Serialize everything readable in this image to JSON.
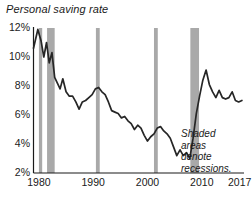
{
  "chart_data": {
    "type": "line",
    "title": "Personal saving rate",
    "xlabel": "",
    "ylabel": "",
    "xlim": [
      1979.0,
      2017.6
    ],
    "ylim": [
      2,
      12
    ],
    "grid": false,
    "legend": false,
    "y_tick_labels": [
      "12%",
      "10%",
      "8%",
      "6%",
      "4%",
      "2%"
    ],
    "y_tick_values": [
      12,
      10,
      8,
      6,
      4,
      2
    ],
    "x_tick_labels": [
      "1980",
      "1990",
      "2000",
      "2010",
      "2017"
    ],
    "x_tick_values": [
      1980,
      1990,
      2000,
      2010,
      2017
    ],
    "line_color": "#262626",
    "shade_color": "#a9a9a9",
    "axis_color": "#1a1a1a",
    "annotation": {
      "lines": [
        "Shaded",
        "areas",
        "denote",
        "recessions."
      ],
      "text": "Shaded areas denote recessions."
    },
    "recessions": [
      {
        "label": "1980",
        "start": 1980.0,
        "end": 1980.6
      },
      {
        "label": "1981-82",
        "start": 1981.5,
        "end": 1982.9
      },
      {
        "label": "1990-91",
        "start": 1990.5,
        "end": 1991.2
      },
      {
        "label": "2001",
        "start": 2001.2,
        "end": 2001.9
      },
      {
        "label": "2007-09",
        "start": 2007.9,
        "end": 2009.5
      }
    ],
    "series": [
      {
        "name": "Personal saving rate",
        "x": [
          1979.0,
          1979.8,
          1980.4,
          1980.9,
          1981.4,
          1981.9,
          1982.4,
          1982.9,
          1983.4,
          1983.9,
          1984.4,
          1985.0,
          1985.6,
          1986.2,
          1986.8,
          1987.4,
          1988.0,
          1988.6,
          1989.2,
          1989.8,
          1990.4,
          1991.0,
          1991.6,
          1992.2,
          1992.8,
          1993.4,
          1994.0,
          1994.6,
          1995.2,
          1995.8,
          1996.4,
          1997.0,
          1997.6,
          1998.2,
          1998.8,
          1999.4,
          2000.0,
          2000.6,
          2001.2,
          2001.8,
          2002.4,
          2003.0,
          2003.6,
          2004.2,
          2004.8,
          2005.4,
          2006.0,
          2006.6,
          2007.2,
          2007.8,
          2008.4,
          2009.0,
          2009.6,
          2010.2,
          2010.8,
          2011.4,
          2012.0,
          2012.6,
          2013.2,
          2013.8,
          2014.4,
          2015.0,
          2015.6,
          2016.2,
          2016.8,
          2017.4
        ],
        "y": [
          10.6,
          11.9,
          11.1,
          10.0,
          11.0,
          9.6,
          10.3,
          8.6,
          8.2,
          7.8,
          8.5,
          7.6,
          7.3,
          7.3,
          6.9,
          6.4,
          6.9,
          7.0,
          7.2,
          7.4,
          7.8,
          7.9,
          7.6,
          7.4,
          6.9,
          6.3,
          6.2,
          6.1,
          5.8,
          5.9,
          5.6,
          5.4,
          5.0,
          5.3,
          5.1,
          4.6,
          4.2,
          4.5,
          4.7,
          5.1,
          5.2,
          4.9,
          4.7,
          4.4,
          3.8,
          3.2,
          3.6,
          3.2,
          3.4,
          3.0,
          4.4,
          6.1,
          7.3,
          8.4,
          9.1,
          8.1,
          7.6,
          7.2,
          7.7,
          7.2,
          7.1,
          7.2,
          7.6,
          7.0,
          6.9,
          7.0
        ]
      }
    ]
  }
}
